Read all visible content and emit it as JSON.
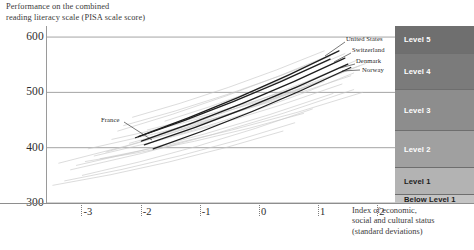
{
  "y_axis": {
    "caption_line1": "Performance on the combined",
    "caption_line2": "reading literacy scale (PISA scale score)",
    "ticks": [
      {
        "label": "600",
        "value": 600
      },
      {
        "label": "500",
        "value": 500
      },
      {
        "label": "400",
        "value": 400
      },
      {
        "label": "300",
        "value": 300
      }
    ]
  },
  "panel": {
    "title_line1": "B. Countries with mean performance not statistically",
    "title_line2": "significantly different from the OECD average"
  },
  "x_axis": {
    "caption_line1": "Index of economic,",
    "caption_line2": "social and cultural status",
    "caption_line3": "(standard deviations)",
    "ticks": [
      {
        "label": "-3",
        "value": -3
      },
      {
        "label": "-2",
        "value": -2
      },
      {
        "label": "-1",
        "value": -1
      },
      {
        "label": "0",
        "value": 0
      },
      {
        "label": "1",
        "value": 1
      },
      {
        "label": "2",
        "value": 2
      }
    ]
  },
  "levels": [
    {
      "label": "Level 5",
      "color": "#6f6f6f",
      "top": 0,
      "bottom": 27
    },
    {
      "label": "Level 4",
      "color": "#7b7b7b",
      "top": 27,
      "bottom": 63
    },
    {
      "label": "Level 3",
      "color": "#8d8d8d",
      "top": 63,
      "bottom": 104
    },
    {
      "label": "Level 2",
      "color": "#a0a0a0",
      "top": 104,
      "bottom": 141
    },
    {
      "label": "Level 1",
      "color": "#b3b3b3",
      "top": 141,
      "bottom": 168
    },
    {
      "label": "Below Level 1",
      "color": "#c4c4c4",
      "top": 168,
      "bottom": 177
    }
  ],
  "highlighted_countries": [
    {
      "name": "United States",
      "label_x": 346,
      "label_y": 40,
      "leader_from_x": 345,
      "leader_from_y": 42,
      "leader_to_x": 325,
      "leader_to_y": 56
    },
    {
      "name": "Switzerland",
      "label_x": 352,
      "label_y": 51,
      "leader_from_x": 351,
      "leader_from_y": 53,
      "leader_to_x": 334,
      "leader_to_y": 62
    },
    {
      "name": "Denmark",
      "label_x": 356,
      "label_y": 62,
      "leader_from_x": 355,
      "leader_from_y": 64,
      "leader_to_x": 340,
      "leader_to_y": 68
    },
    {
      "name": "Norway",
      "label_x": 362,
      "label_y": 71,
      "leader_from_x": 360,
      "leader_from_y": 70,
      "leader_to_x": 342,
      "leader_to_y": 71
    }
  ],
  "france_annotation": {
    "name": "France",
    "label_x": 101,
    "label_y": 121,
    "leader_from_x": 124,
    "leader_from_y": 122,
    "leader_to_x": 152,
    "leader_to_y": 140
  },
  "colors": {
    "background": "#ffffff",
    "gridline": "#9a9a9a",
    "axis": "#8e8e8e",
    "faint_line": "#c8c8c8",
    "highlight_line": "#1e1e1e",
    "text": "#2b2b2b"
  },
  "chart_data": {
    "type": "line",
    "title": "B. Countries with mean performance not statistically significantly different from the OECD average",
    "subtitle": "Performance on the combined reading literacy scale (PISA scale score)",
    "xlabel": "Index of economic, social and cultural status (standard deviations)",
    "ylabel": "Performance on the combined reading literacy scale (PISA scale score)",
    "xlim": [
      -3.6,
      2.3
    ],
    "ylim": [
      300,
      620
    ],
    "xticks": [
      -3,
      -2,
      -1,
      0,
      1,
      2
    ],
    "yticks": [
      300,
      400,
      500,
      600
    ],
    "grid": true,
    "legend_position": "inline-annotations",
    "proficiency_bands": [
      {
        "name": "Below Level 1",
        "y_range": [
          300,
          334
        ]
      },
      {
        "name": "Level 1",
        "y_range": [
          334,
          390
        ]
      },
      {
        "name": "Level 2",
        "y_range": [
          390,
          459
        ]
      },
      {
        "name": "Level 3",
        "y_range": [
          459,
          525
        ]
      },
      {
        "name": "Level 4",
        "y_range": [
          525,
          570
        ]
      },
      {
        "name": "Level 5",
        "y_range": [
          570,
          620
        ]
      }
    ],
    "series": [
      {
        "name": "United States",
        "highlight": true,
        "x": [
          -2.05,
          1.35
        ],
        "y": [
          420,
          575
        ]
      },
      {
        "name": "Switzerland",
        "highlight": true,
        "x": [
          -2.0,
          1.45
        ],
        "y": [
          412,
          562
        ]
      },
      {
        "name": "Denmark",
        "highlight": true,
        "x": [
          -1.95,
          1.5
        ],
        "y": [
          405,
          551
        ]
      },
      {
        "name": "Norway",
        "highlight": true,
        "x": [
          -1.8,
          1.55
        ],
        "y": [
          398,
          545
        ]
      },
      {
        "name": "France",
        "highlight": true,
        "x": [
          -2.1,
          1.2
        ],
        "y": [
          418,
          560
        ]
      },
      {
        "name": "other-1",
        "highlight": false,
        "x": [
          -3.4,
          1.1
        ],
        "y": [
          372,
          520
        ]
      },
      {
        "name": "other-2",
        "highlight": false,
        "x": [
          -3.2,
          1.6
        ],
        "y": [
          360,
          505
        ]
      },
      {
        "name": "other-3",
        "highlight": false,
        "x": [
          -2.6,
          1.7
        ],
        "y": [
          392,
          548
        ]
      },
      {
        "name": "other-4",
        "highlight": false,
        "x": [
          -2.4,
          1.3
        ],
        "y": [
          430,
          572
        ]
      },
      {
        "name": "other-5",
        "highlight": false,
        "x": [
          -2.2,
          1.5
        ],
        "y": [
          408,
          540
        ]
      },
      {
        "name": "other-6",
        "highlight": false,
        "x": [
          -3.0,
          0.9
        ],
        "y": [
          350,
          470
        ]
      },
      {
        "name": "other-7",
        "highlight": false,
        "x": [
          -2.8,
          1.4
        ],
        "y": [
          385,
          515
        ]
      },
      {
        "name": "other-8",
        "highlight": false,
        "x": [
          -1.7,
          1.65
        ],
        "y": [
          425,
          558
        ]
      },
      {
        "name": "other-9",
        "highlight": false,
        "x": [
          -2.3,
          1.2
        ],
        "y": [
          440,
          565
        ]
      },
      {
        "name": "other-10",
        "highlight": false,
        "x": [
          -3.3,
          0.6
        ],
        "y": [
          340,
          445
        ]
      },
      {
        "name": "other-11",
        "highlight": false,
        "x": [
          -2.9,
          1.55
        ],
        "y": [
          398,
          530
        ]
      },
      {
        "name": "other-12",
        "highlight": false,
        "x": [
          -1.6,
          1.45
        ],
        "y": [
          448,
          570
        ]
      },
      {
        "name": "other-13",
        "highlight": false,
        "x": [
          -2.5,
          1.0
        ],
        "y": [
          415,
          518
        ]
      },
      {
        "name": "other-14",
        "highlight": false,
        "x": [
          -3.1,
          1.25
        ],
        "y": [
          368,
          498
        ]
      },
      {
        "name": "other-15",
        "highlight": false,
        "x": [
          -2.7,
          1.75
        ],
        "y": [
          380,
          500
        ]
      },
      {
        "name": "other-16",
        "highlight": false,
        "x": [
          -1.9,
          1.8
        ],
        "y": [
          432,
          552
        ]
      },
      {
        "name": "other-17",
        "highlight": false,
        "x": [
          -3.5,
          0.4
        ],
        "y": [
          332,
          430
        ]
      },
      {
        "name": "other-18",
        "highlight": false,
        "x": [
          -2.15,
          1.1
        ],
        "y": [
          455,
          575
        ]
      },
      {
        "name": "other-19",
        "highlight": false,
        "x": [
          -1.5,
          1.6
        ],
        "y": [
          420,
          535
        ]
      },
      {
        "name": "other-20",
        "highlight": false,
        "x": [
          -2.95,
          0.75
        ],
        "y": [
          375,
          462
        ]
      }
    ]
  }
}
